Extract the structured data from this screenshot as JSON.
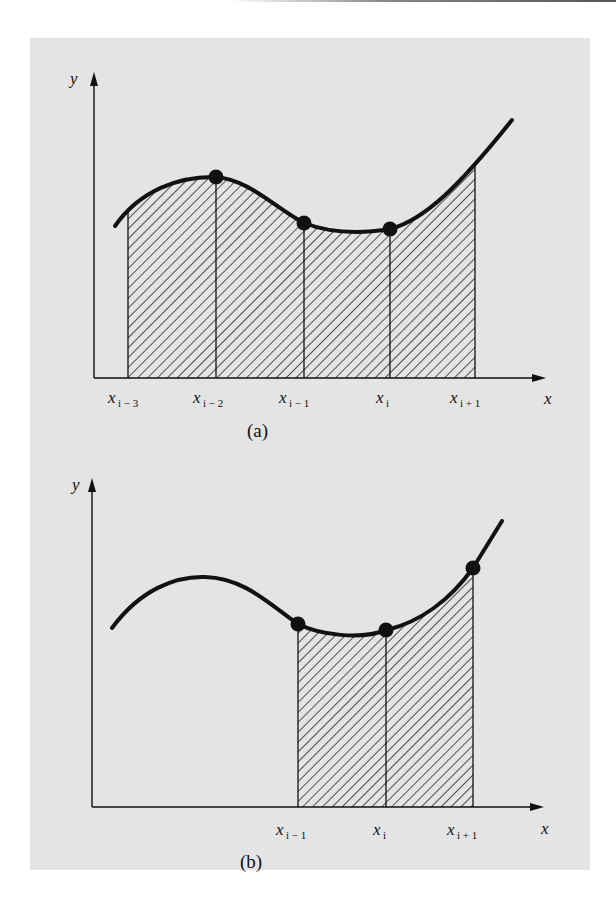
{
  "figure": {
    "panel_background": "#e4e4e4",
    "ink_color": "#111111",
    "panels": [
      {
        "id": "a",
        "caption": "(a)",
        "y_axis_label": "y",
        "x_axis_label": "x",
        "ticks": [
          {
            "base": "x",
            "sub": "i − 3"
          },
          {
            "base": "x",
            "sub": "i − 2"
          },
          {
            "base": "x",
            "sub": "i − 1"
          },
          {
            "base": "x",
            "sub": "i"
          },
          {
            "base": "x",
            "sub": "i + 1"
          }
        ],
        "hatched_intervals": [
          "x_{i-3} to x_{i-2}",
          "x_{i-2} to x_{i-1}",
          "x_{i-1} to x_i",
          "x_i to x_{i+1}"
        ],
        "marked_points": [
          "x_{i-2}",
          "x_{i-1}",
          "x_i"
        ]
      },
      {
        "id": "b",
        "caption": "(b)",
        "y_axis_label": "y",
        "x_axis_label": "x",
        "ticks": [
          {
            "base": "x",
            "sub": "i − 1"
          },
          {
            "base": "x",
            "sub": "i"
          },
          {
            "base": "x",
            "sub": "i + 1"
          }
        ],
        "hatched_intervals": [
          "x_{i-1} to x_i",
          "x_i to x_{i+1}"
        ],
        "marked_points": [
          "x_{i-1}",
          "x_i",
          "x_{i+1}"
        ]
      }
    ]
  }
}
